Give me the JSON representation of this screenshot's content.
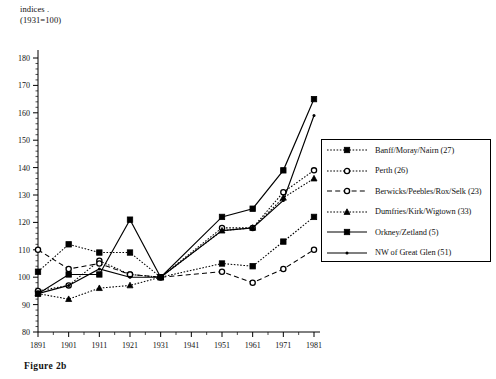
{
  "figure": {
    "caption": "Figure  2b",
    "axis_note_line1": "indices .",
    "axis_note_line2": "(1931=100)"
  },
  "chart_data": {
    "type": "line",
    "title": "",
    "subtitle": "",
    "xlabel": "",
    "ylabel": "indices . (1931=100)",
    "x": [
      1891,
      1901,
      1911,
      1921,
      1931,
      1941,
      1951,
      1961,
      1971,
      1981
    ],
    "xtick_labels": [
      "1891",
      "1901",
      "1911",
      "1921",
      "1931",
      "1941",
      "1951",
      "1961",
      "1971",
      "1981"
    ],
    "xlim": [
      1891,
      1981
    ],
    "ylim": [
      80,
      180
    ],
    "ytick_labels": [
      "80",
      "90",
      "100",
      "110",
      "120",
      "130",
      "140",
      "150",
      "160",
      "170",
      "180"
    ],
    "ytick_values": [
      80,
      90,
      100,
      110,
      120,
      130,
      140,
      150,
      160,
      170,
      180
    ],
    "yminor_step": 2,
    "grid": false,
    "legend_position": "right",
    "series": [
      {
        "name": "Banff/Moray/Nairn (27)",
        "count": 27,
        "marker": "filled-square",
        "linestyle": "dotted",
        "color": "#000000",
        "x": [
          1891,
          1901,
          1911,
          1921,
          1931,
          1951,
          1961,
          1971,
          1981
        ],
        "values": [
          102,
          112,
          109,
          109,
          100,
          105,
          104,
          113,
          122
        ]
      },
      {
        "name": "Perth (26)",
        "count": 26,
        "marker": "open-circle",
        "linestyle": "dotted",
        "color": "#000000",
        "x": [
          1891,
          1901,
          1911,
          1921,
          1931,
          1951,
          1961,
          1971,
          1981
        ],
        "values": [
          95,
          97,
          106,
          101,
          100,
          118,
          118,
          131,
          139
        ]
      },
      {
        "name": "Berwicks/Peebles/Rox/Selk (23)",
        "count": 23,
        "marker": "open-circle",
        "linestyle": "dashed",
        "color": "#000000",
        "x": [
          1891,
          1901,
          1911,
          1921,
          1931,
          1951,
          1961,
          1971,
          1981
        ],
        "values": [
          110,
          103,
          105,
          101,
          100,
          102,
          98,
          103,
          110
        ]
      },
      {
        "name": "Dumfries/Kirk/Wigtown (33)",
        "count": 33,
        "marker": "filled-triangle",
        "linestyle": "dotted",
        "color": "#000000",
        "x": [
          1891,
          1901,
          1911,
          1921,
          1931,
          1951,
          1961,
          1971,
          1981
        ],
        "values": [
          94,
          92,
          96,
          97,
          100,
          117,
          118,
          129,
          136
        ]
      },
      {
        "name": "Orkney/Zetland (5)",
        "count": 5,
        "marker": "filled-square",
        "linestyle": "solid",
        "color": "#000000",
        "x": [
          1891,
          1901,
          1911,
          1921,
          1931,
          1951,
          1961,
          1971,
          1981
        ],
        "values": [
          94,
          101,
          101,
          121,
          100,
          122,
          125,
          139,
          165
        ]
      },
      {
        "name": "NW of Great Glen (51)",
        "count": 51,
        "marker": "small-dot",
        "linestyle": "solid",
        "color": "#000000",
        "x": [
          1891,
          1901,
          1911,
          1921,
          1931,
          1951,
          1961,
          1971,
          1981
        ],
        "values": [
          94,
          97,
          103,
          100,
          100,
          117,
          118,
          128,
          159
        ]
      }
    ]
  }
}
